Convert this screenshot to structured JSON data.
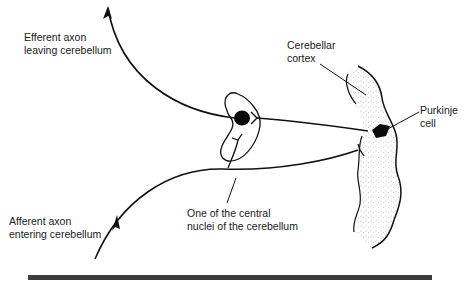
{
  "diagram": {
    "labels": {
      "efferent": [
        "Efferent axon",
        "leaving cerebellum"
      ],
      "cortex": [
        "Cerebellar",
        "cortex"
      ],
      "purkinje": [
        "Purkinje",
        "cell"
      ],
      "afferent": [
        "Afferent axon",
        "entering cerebellum"
      ],
      "nucleus": [
        "One of the central",
        "nuclei of the cerebellum"
      ]
    },
    "colors": {
      "ink": "#111111",
      "stipple": "#8a8a8a",
      "rule": "#3c3c3c",
      "background": "#ffffff"
    }
  }
}
